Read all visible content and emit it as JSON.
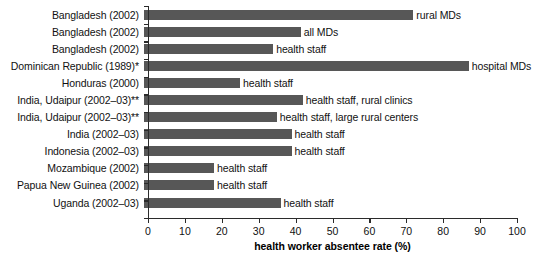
{
  "chart_data": {
    "type": "bar",
    "orientation": "horizontal",
    "title": "",
    "xlabel": "health worker absentee rate (%)",
    "ylabel": "",
    "xlim": [
      0,
      100
    ],
    "xticks": [
      0,
      10,
      20,
      30,
      40,
      50,
      60,
      70,
      80,
      90,
      100
    ],
    "grid": false,
    "legend": false,
    "categories": [
      "Bangladesh (2002)",
      "Bangladesh (2002)",
      "Bangladesh (2002)",
      "Dominican Republic (1989)*",
      "Honduras (2000)",
      "India, Udaipur (2002–03)**",
      "India, Udaipur (2002–03)**",
      "India (2002–03)",
      "Indonesia (2002–03)",
      "Mozambique (2002)",
      "Papua New Guinea (2002)",
      "Uganda (2002–03)"
    ],
    "values": [
      73,
      42.5,
      35,
      88,
      26,
      43,
      36,
      40,
      40,
      19,
      19,
      37
    ],
    "point_labels": [
      "rural MDs",
      "all MDs",
      "health staff",
      "hospital MDs",
      "health staff",
      "health staff, rural clinics",
      "health staff, large rural centers",
      "health staff",
      "health staff",
      "health staff",
      "health staff",
      "health staff"
    ],
    "bar_color": "#575757",
    "axis_color": "#2b2b2b"
  }
}
